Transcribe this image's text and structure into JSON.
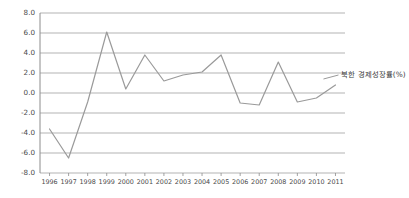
{
  "chart_data": {
    "type": "line",
    "title": "",
    "xlabel": "",
    "ylabel": "",
    "categories": [
      "1996",
      "1997",
      "1998",
      "1999",
      "2000",
      "2001",
      "2002",
      "2003",
      "2004",
      "2005",
      "2006",
      "2007",
      "2008",
      "2009",
      "2010",
      "2011"
    ],
    "series": [
      {
        "name": "북한 경제성장률(%)",
        "values": [
          -3.6,
          -6.5,
          -0.9,
          6.1,
          0.4,
          3.8,
          1.2,
          1.8,
          2.1,
          3.8,
          -1.0,
          -1.2,
          3.1,
          -0.9,
          -0.5,
          0.8
        ],
        "color": "#9a9a9a"
      }
    ],
    "annotations": [
      {
        "name": "series-callout",
        "text": "북한 경제성장률(%)"
      }
    ],
    "ylim": [
      -8.0,
      8.0
    ],
    "ytick_values": [
      8.0,
      6.0,
      4.0,
      2.0,
      0.0,
      -2.0,
      -4.0,
      -6.0,
      -8.0
    ],
    "ytick_labels": [
      "8.0",
      "6.0",
      "4.0",
      "2.0",
      "0.0",
      "-2.0",
      "-4.0",
      "-6.0",
      "-8.0"
    ],
    "grid": true,
    "grid_color": "#aaaaaa",
    "legend": "none",
    "axis_color": "#8c8c8c",
    "background": "#ffffff"
  }
}
